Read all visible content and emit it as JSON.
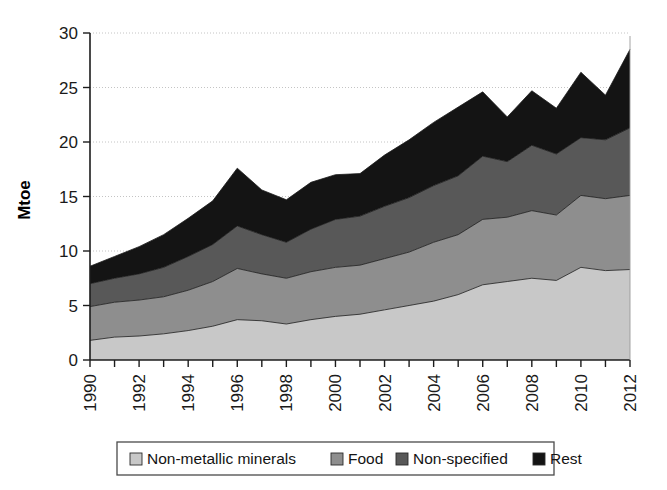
{
  "chart_data": {
    "type": "area",
    "stacked": true,
    "title": "",
    "subtitle": "",
    "xlabel": "",
    "ylabel": "Mtoe",
    "xlim": [
      1990,
      2012
    ],
    "ylim": [
      0,
      30
    ],
    "yticks": [
      0,
      5,
      10,
      15,
      20,
      25,
      30
    ],
    "ytick_labels": [
      "0",
      "5",
      "10",
      "15",
      "20",
      "25",
      "30"
    ],
    "xticks": [
      1990,
      1991,
      1992,
      1993,
      1994,
      1995,
      1996,
      1997,
      1998,
      1999,
      2000,
      2001,
      2002,
      2003,
      2004,
      2005,
      2006,
      2007,
      2008,
      2009,
      2010,
      2011,
      2012
    ],
    "xtick_labels_shown": [
      "1990",
      "1992",
      "1994",
      "1996",
      "1998",
      "2000",
      "2002",
      "2004",
      "2006",
      "2008",
      "2010",
      "2012"
    ],
    "xtick_label_interval": 2,
    "xtick_label_rotation": 90,
    "grid": "horizontal-dotted",
    "legend_position": "bottom",
    "x": [
      1990,
      1991,
      1992,
      1993,
      1994,
      1995,
      1996,
      1997,
      1998,
      1999,
      2000,
      2001,
      2002,
      2003,
      2004,
      2005,
      2006,
      2007,
      2008,
      2009,
      2010,
      2011,
      2012
    ],
    "series": [
      {
        "name": "Non-metallic minerals",
        "color": "#c8c8c8",
        "values": [
          1.8,
          2.1,
          2.2,
          2.4,
          2.7,
          3.1,
          3.7,
          3.6,
          3.3,
          3.7,
          4.0,
          4.2,
          4.6,
          5.0,
          5.4,
          6.0,
          6.9,
          7.2,
          7.5,
          7.3,
          8.5,
          8.2,
          8.3
        ]
      },
      {
        "name": "Food",
        "color": "#8e8e8e",
        "values": [
          3.1,
          3.2,
          3.3,
          3.4,
          3.7,
          4.1,
          4.7,
          4.3,
          4.2,
          4.4,
          4.5,
          4.5,
          4.7,
          4.9,
          5.4,
          5.5,
          6.0,
          5.9,
          6.2,
          6.0,
          6.6,
          6.6,
          6.8
        ]
      },
      {
        "name": "Non-specified",
        "color": "#585858",
        "values": [
          2.1,
          2.2,
          2.4,
          2.7,
          3.1,
          3.4,
          3.9,
          3.6,
          3.3,
          3.9,
          4.4,
          4.5,
          4.8,
          5.0,
          5.2,
          5.4,
          5.8,
          5.1,
          6.0,
          5.6,
          5.3,
          5.4,
          6.2
        ]
      },
      {
        "name": "Rest",
        "color": "#141414",
        "values": [
          1.6,
          2.0,
          2.5,
          3.0,
          3.5,
          4.0,
          5.3,
          4.1,
          3.9,
          4.3,
          4.1,
          3.9,
          4.7,
          5.3,
          5.8,
          6.3,
          5.9,
          4.1,
          5.0,
          4.2,
          6.0,
          4.1,
          7.2
        ]
      }
    ],
    "totals": [
      8.6,
      9.5,
      10.4,
      11.5,
      13.0,
      14.6,
      17.6,
      15.6,
      14.7,
      16.3,
      17.0,
      17.1,
      18.8,
      20.2,
      21.8,
      23.2,
      24.6,
      22.3,
      24.7,
      23.1,
      26.4,
      24.3,
      28.5
    ]
  },
  "legend": {
    "items": [
      {
        "label": "Non-metallic minerals",
        "color": "#c8c8c8"
      },
      {
        "label": "Food",
        "color": "#8e8e8e"
      },
      {
        "label": "Non-specified",
        "color": "#585858"
      },
      {
        "label": "Rest",
        "color": "#141414"
      }
    ]
  },
  "axes": {
    "y_title": "Mtoe"
  }
}
